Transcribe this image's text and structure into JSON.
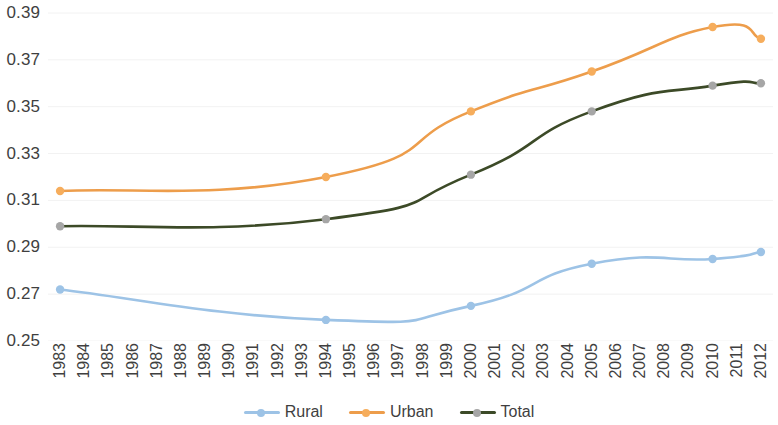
{
  "chart_data": {
    "type": "line",
    "title": "",
    "subtitle": "",
    "xlabel": "",
    "ylabel": "",
    "grid": true,
    "legend_position": "bottom",
    "ylim": [
      0.25,
      0.39
    ],
    "yticks": [
      "0.39",
      "0.37",
      "0.35",
      "0.33",
      "0.31",
      "0.29",
      "0.27",
      "0.25"
    ],
    "ytick_values": [
      0.39,
      0.37,
      0.35,
      0.33,
      0.31,
      0.29,
      0.27,
      0.25
    ],
    "categories": [
      "1983",
      "1984",
      "1985",
      "1986",
      "1987",
      "1988",
      "1989",
      "1990",
      "1991",
      "1992",
      "1993",
      "1994",
      "1995",
      "1996",
      "1997",
      "1998",
      "1999",
      "2000",
      "2001",
      "2002",
      "2003",
      "2004",
      "2005",
      "2006",
      "2007",
      "2008",
      "2009",
      "2010",
      "2011",
      "2012"
    ],
    "marker_categories": [
      "1983",
      "1994",
      "2000",
      "2005",
      "2010",
      "2012"
    ],
    "series": [
      {
        "name": "Rural",
        "color": "#9dc3e6",
        "marker_color": "#9dc3e6",
        "x": [
          "1983",
          "1994",
          "2000",
          "2005",
          "2010",
          "2012"
        ],
        "values": [
          0.272,
          0.259,
          0.265,
          0.283,
          0.285,
          0.288
        ]
      },
      {
        "name": "Urban",
        "color": "#ed9d4b",
        "marker_color": "#f6ad5c",
        "x": [
          "1983",
          "1994",
          "2000",
          "2005",
          "2010",
          "2012"
        ],
        "values": [
          0.314,
          0.32,
          0.348,
          0.365,
          0.384,
          0.379
        ]
      },
      {
        "name": "Total",
        "color": "#3c4a27",
        "marker_color": "#a6a6a6",
        "x": [
          "1983",
          "1994",
          "2000",
          "2005",
          "2010",
          "2012"
        ],
        "values": [
          0.299,
          0.302,
          0.321,
          0.348,
          0.359,
          0.36
        ]
      }
    ]
  },
  "legend": {
    "items": [
      {
        "label": "Rural"
      },
      {
        "label": "Urban"
      },
      {
        "label": "Total"
      }
    ]
  },
  "colors": {
    "rural": "#9dc3e6",
    "urban": "#ed9d4b",
    "total": "#3c4a27",
    "total_marker": "#a6a6a6",
    "gridline": "#f2f2f2",
    "text": "#3f3f3f",
    "background": "#ffffff"
  }
}
